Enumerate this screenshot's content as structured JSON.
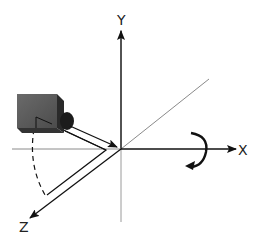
{
  "diagram": {
    "type": "3d-coordinate-system-camera",
    "axes": {
      "x_label": "X",
      "y_label": "Y",
      "z_label": "Z"
    },
    "elements": [
      {
        "name": "camera",
        "description": "camera box positioned to the upper-left, pointing at the origin"
      },
      {
        "name": "view-direction-arrow",
        "description": "arrow from camera lens to the origin"
      },
      {
        "name": "rotation-arrow",
        "description": "curved arrow indicating rotation about the X axis"
      },
      {
        "name": "rotation-arc",
        "description": "dashed arc showing camera sweep toward the Z axis"
      }
    ],
    "colors": {
      "axis": "#111111",
      "diagonal": "#8a8a8a",
      "camera_face": "#5a5a5a",
      "camera_shadow": "#1e1e1e"
    }
  }
}
